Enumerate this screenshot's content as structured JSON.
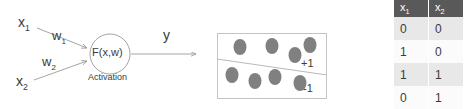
{
  "diagram": {
    "inputs": [
      {
        "name": "input-1",
        "label": "x",
        "subscript": "1"
      },
      {
        "name": "input-2",
        "label": "x",
        "subscript": "2"
      }
    ],
    "weights": [
      {
        "name": "weight-1",
        "label": "w",
        "subscript": "1"
      },
      {
        "name": "weight-2",
        "label": "w",
        "subscript": "2"
      }
    ],
    "node": {
      "function_label": "F(x,w)",
      "caption": "Activation"
    },
    "output": {
      "label": "y"
    },
    "colors": {
      "stroke": "#9a9a9a",
      "text": "#3b3b3b",
      "node_fill": "#ffffff"
    }
  },
  "scatter": {
    "name": "linear-separability-plot",
    "class_positive_label": "+1",
    "class_negative_label": "-1",
    "dot_color": "#808080",
    "border_color": "#c4c4c4",
    "boundary_color": "#b9b9b9",
    "points": [
      {
        "x": 23,
        "y": 14,
        "class": "+1"
      },
      {
        "x": 55,
        "y": 13,
        "class": "+1"
      },
      {
        "x": 78,
        "y": 22,
        "class": "+1"
      },
      {
        "x": 93,
        "y": 12,
        "class": "+1"
      },
      {
        "x": 15,
        "y": 42,
        "class": "-1"
      },
      {
        "x": 38,
        "y": 48,
        "class": "-1"
      },
      {
        "x": 58,
        "y": 44,
        "class": "-1"
      },
      {
        "x": 83,
        "y": 50,
        "class": "-1"
      }
    ],
    "boundary": {
      "x1": 0,
      "y1": 26,
      "x2": 110,
      "y2": 42
    }
  },
  "table": {
    "name": "input-truth-table",
    "headers": [
      {
        "label": "x",
        "subscript": "1"
      },
      {
        "label": "x",
        "subscript": "2"
      }
    ],
    "rows": [
      [
        "0",
        "0"
      ],
      [
        "1",
        "0"
      ],
      [
        "1",
        "1"
      ],
      [
        "0",
        "1"
      ]
    ],
    "header_bg": "#595959",
    "row_shaded_bg": "#e8e8e8",
    "row_plain_bg": "#fbfbfb"
  }
}
